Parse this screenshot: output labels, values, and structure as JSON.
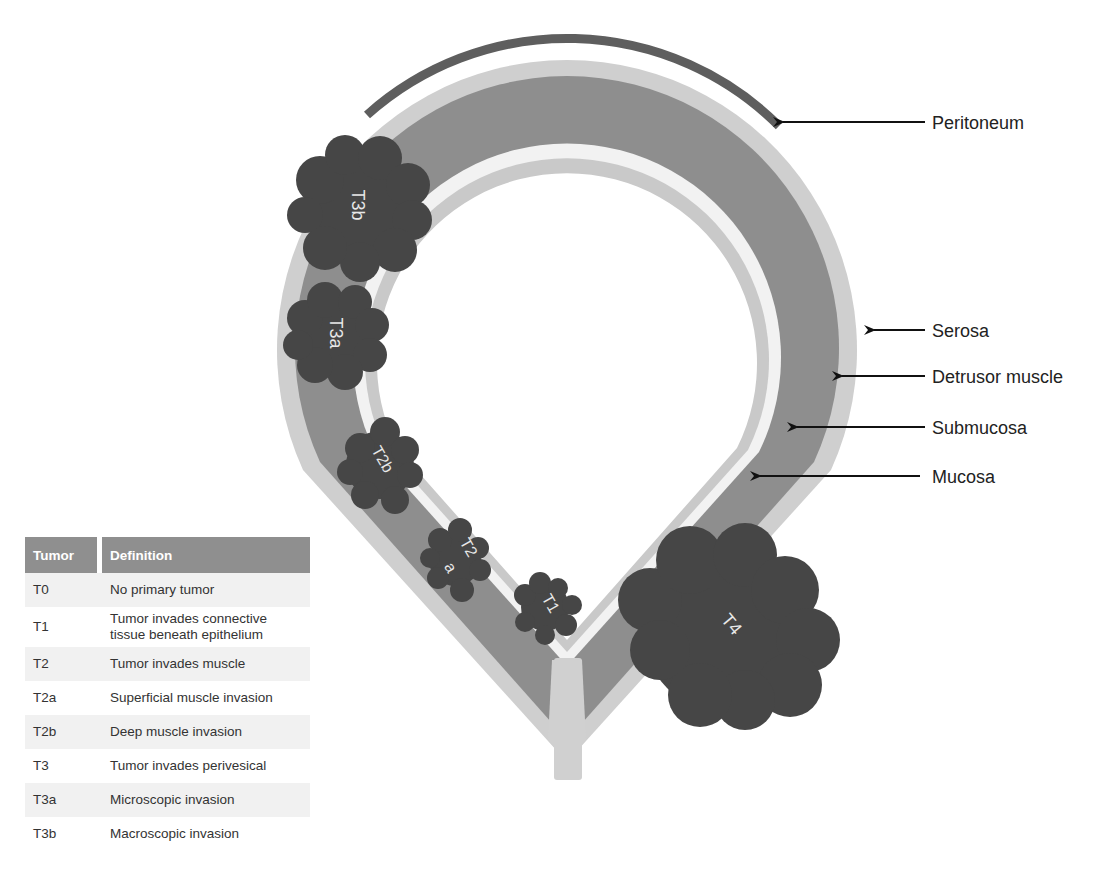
{
  "colors": {
    "peritoneum": "#5e5e5e",
    "serosa": "#cfcfcf",
    "detrusor_muscle": "#8e8e8e",
    "submucosa": "#f2f2f2",
    "mucosa": "#c9c9c9",
    "tumor": "#464646",
    "table_header": "#8f8f8f",
    "table_alt_row": "#f1f1f1"
  },
  "layers": {
    "peritoneum": "Peritoneum",
    "serosa": "Serosa",
    "detrusor": "Detrusor muscle",
    "submucosa": "Submucosa",
    "mucosa": "Mucosa"
  },
  "tumors": {
    "t3b": "T3b",
    "t3a": "T3a",
    "t2b": "T2b",
    "t2a_line1": "T2",
    "t2a_line2": "a",
    "t1": "T1",
    "t4": "T4"
  },
  "table": {
    "headers": [
      "Tumor",
      "Definition"
    ],
    "rows": [
      {
        "stage": "T0",
        "definition": "No primary tumor"
      },
      {
        "stage": "T1",
        "definition": "Tumor invades connective",
        "definition_line2": "tissue beneath epithelium"
      },
      {
        "stage": "T2",
        "definition": "Tumor invades muscle"
      },
      {
        "stage": "T2a",
        "definition": "Superficial muscle invasion"
      },
      {
        "stage": "T2b",
        "definition": "Deep muscle invasion"
      },
      {
        "stage": "T3",
        "definition": "Tumor invades perivesical"
      },
      {
        "stage": "T3a",
        "definition": "Microscopic invasion"
      },
      {
        "stage": "T3b",
        "definition": "Macroscopic invasion"
      }
    ]
  }
}
